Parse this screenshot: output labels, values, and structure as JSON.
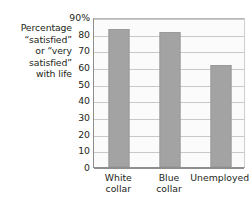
{
  "chart_data": {
    "type": "bar",
    "title": "",
    "subtitle": "",
    "xlabel": "",
    "ylabel": "Percentage “satisfied” or “very satisfied” with life",
    "ylabel_lines": [
      "Percentage",
      "“satisfied”",
      "or “very",
      "satisfied”",
      "with life"
    ],
    "categories": [
      "White collar",
      "Blue collar",
      "Unemployed"
    ],
    "category_lines": [
      [
        "White",
        "collar"
      ],
      [
        "Blue",
        "collar"
      ],
      [
        "Unemployed"
      ]
    ],
    "values": [
      83,
      81,
      61
    ],
    "ylim": [
      0,
      90
    ],
    "ytick_values": [
      90,
      80,
      70,
      60,
      50,
      40,
      30,
      20,
      10,
      0
    ],
    "ytick_labels": [
      "90%",
      "80",
      "70",
      "60",
      "50",
      "40",
      "30",
      "20",
      "10",
      "0"
    ],
    "grid": true,
    "grid_orientation": "horizontal",
    "legend": false,
    "legend_position": "none",
    "bar_color": "#a3a3a3",
    "plot_background": "#fbfbfb",
    "grid_color": "#c9c9c9",
    "axis_color": "#8e8e8e",
    "text_color": "#231f20"
  }
}
